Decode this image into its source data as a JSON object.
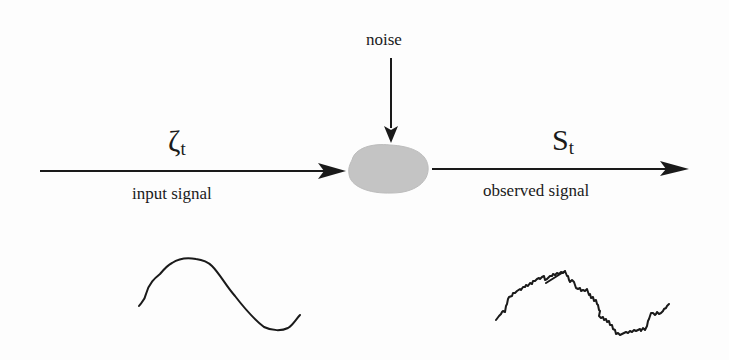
{
  "diagram": {
    "noise_label": "noise",
    "input": {
      "symbol": "ζ",
      "subscript": "t",
      "label": "input signal"
    },
    "output": {
      "symbol": "S",
      "subscript": "t",
      "label": "observed signal"
    },
    "colors": {
      "line": "#1a1a1a",
      "blob": "#c4c4c4"
    },
    "waveforms": [
      {
        "name": "clean-sine",
        "description": "smooth sine wave under input"
      },
      {
        "name": "noisy-sine",
        "description": "jagged noisy sine wave under output"
      }
    ]
  }
}
